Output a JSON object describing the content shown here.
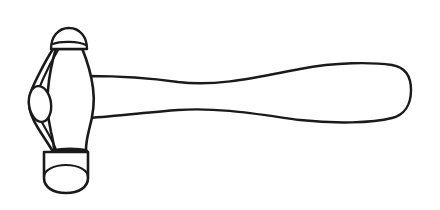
{
  "image": {
    "subject": "ball-peen-hammer",
    "style": "black-and-white line drawing",
    "description": "Outline line art of a ball peen hammer with a cylindrical striking face, rounded peen, and a long tapered wooden handle extending to the right",
    "background_color": "#ffffff",
    "stroke_color": "#1a1a1a",
    "width": 440,
    "height": 210
  },
  "parts": {
    "peen_ball": {
      "name": "ball-peen",
      "description": "rounded dome at the top of the hammer head"
    },
    "neck": {
      "name": "hammer-neck",
      "description": "short straight neck connecting the peen to the head body"
    },
    "head_body": {
      "name": "hammer-head-body",
      "description": "hourglass / waisted body of the hammer head"
    },
    "eye": {
      "name": "hammer-eye",
      "description": "elongated oval eye on the left cheek of the head"
    },
    "side_profile": {
      "name": "head-side-profile",
      "description": "wavy outer contour on the left side of the head"
    },
    "collar": {
      "name": "face-collar",
      "description": "horizontal band line where the striking face meets the head"
    },
    "striking_face": {
      "name": "striking-face",
      "description": "cylindrical flat striking face at the bottom with elliptical rim"
    },
    "face_ellipse": {
      "name": "striking-face-ellipse",
      "description": "ellipse indicating the round bottom face of the cylinder"
    },
    "handle": {
      "name": "hammer-handle",
      "description": "long tapered handle narrowing near the head then widening to a rounded butt end"
    }
  },
  "geometry": {
    "handle_start_x": 88,
    "handle_end_x": 412,
    "handle_top_y": 75,
    "handle_bottom_y": 120,
    "head_top_y": 32,
    "head_bottom_y": 193,
    "head_left_x": 30,
    "head_right_x": 95
  }
}
